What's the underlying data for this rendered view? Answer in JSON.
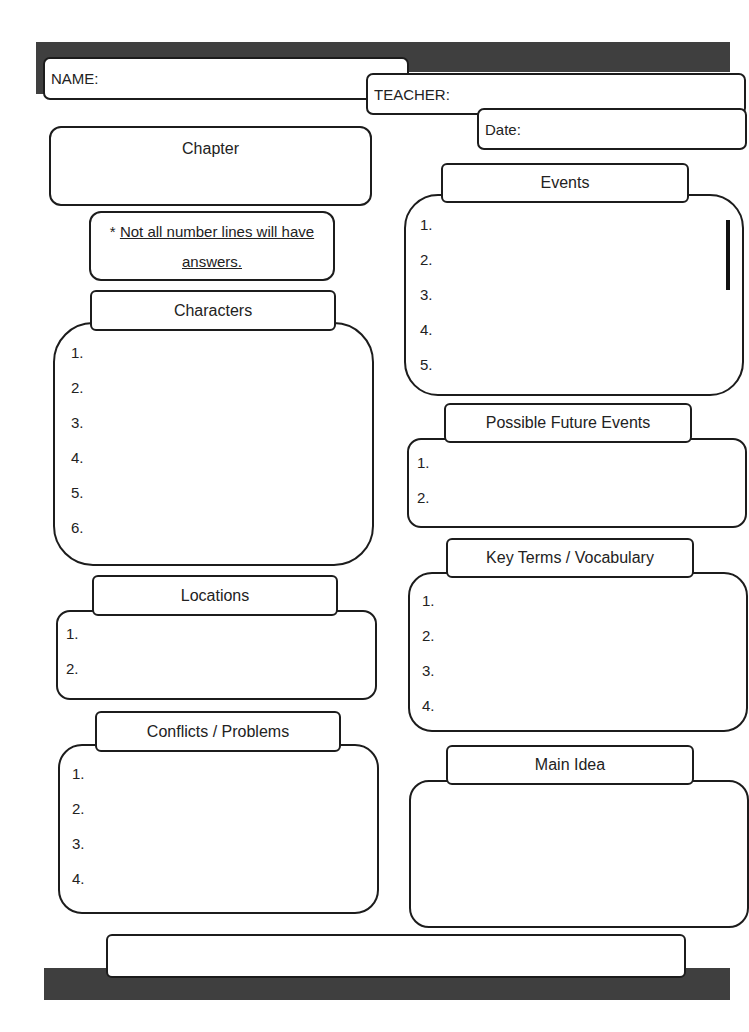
{
  "header": {
    "name_label": "NAME:",
    "teacher_label": "TEACHER:",
    "date_label": "Date:"
  },
  "chapter": {
    "label": "Chapter"
  },
  "note": {
    "asterisk": "* ",
    "line1": "Not all number lines will have",
    "line2": "answers."
  },
  "sections": {
    "characters": {
      "title": "Characters",
      "items": [
        "1.",
        "2.",
        "3.",
        "4.",
        "5.",
        "6."
      ]
    },
    "locations": {
      "title": "Locations",
      "items": [
        "1.",
        "2."
      ]
    },
    "conflicts": {
      "title": "Conflicts / Problems",
      "items": [
        "1.",
        "2.",
        "3.",
        "4."
      ]
    },
    "events": {
      "title": "Events",
      "items": [
        "1.",
        "2.",
        "3.",
        "4.",
        "5."
      ]
    },
    "future_events": {
      "title": "Possible Future Events",
      "items": [
        "1.",
        "2."
      ]
    },
    "vocabulary": {
      "title": "Key Terms / Vocabulary",
      "items": [
        "1.",
        "2.",
        "3.",
        "4."
      ]
    },
    "main_idea": {
      "title": "Main Idea"
    }
  },
  "colors": {
    "bar": "#3f3f3f",
    "border": "#1c1c1c",
    "background": "#ffffff"
  }
}
